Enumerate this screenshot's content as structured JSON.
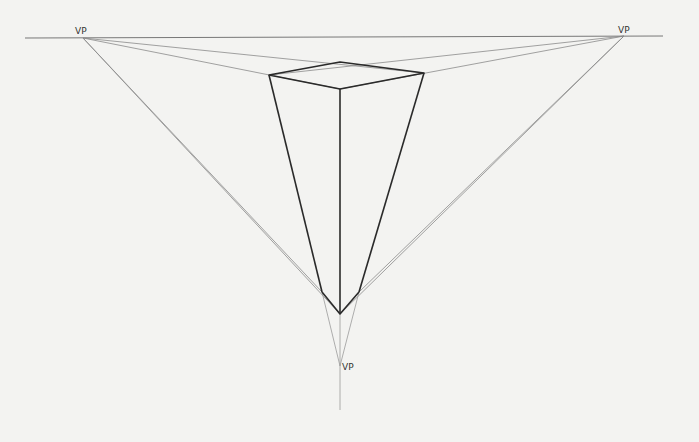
{
  "diagram": {
    "labels": {
      "vp_left": "VP",
      "vp_right": "VP",
      "vp_bottom": "VP"
    },
    "colors": {
      "background": "#f3f3f1",
      "guide": "#8a8a8a",
      "edge": "#2a2a2a"
    }
  }
}
